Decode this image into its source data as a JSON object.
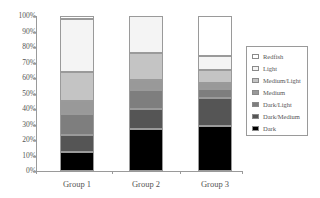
{
  "chart_data": {
    "type": "bar",
    "stacked": true,
    "percent": true,
    "title": "",
    "xlabel": "",
    "ylabel": "",
    "ylim": [
      0,
      100
    ],
    "yticks": [
      "0%",
      "10%",
      "20%",
      "30%",
      "40%",
      "50%",
      "60%",
      "70%",
      "80%",
      "90%",
      "100%"
    ],
    "categories": [
      "Group 1",
      "Group 2",
      "Group 3"
    ],
    "series": [
      {
        "name": "Dark",
        "color": "#000000",
        "values": [
          12,
          27,
          29
        ]
      },
      {
        "name": "Dark/Medium",
        "color": "#555555",
        "values": [
          11,
          13,
          18
        ]
      },
      {
        "name": "Dark/Light",
        "color": "#7e7e7e",
        "values": [
          14,
          12,
          6
        ]
      },
      {
        "name": "Medium",
        "color": "#999999",
        "values": [
          8,
          7,
          4
        ]
      },
      {
        "name": "Medium/Light",
        "color": "#c4c4c4",
        "values": [
          19,
          17,
          8
        ]
      },
      {
        "name": "Light",
        "color": "#f4f4f4",
        "values": [
          34,
          24,
          9
        ]
      },
      {
        "name": "Redfish",
        "color": "#ffffff",
        "values": [
          2,
          0,
          26
        ]
      }
    ],
    "legend": {
      "position": "right",
      "entries": [
        "Redfish",
        "Light",
        "Medium/Light",
        "Medium",
        "Dark/Light",
        "Dark/Medium",
        "Dark"
      ]
    },
    "grid": false
  }
}
